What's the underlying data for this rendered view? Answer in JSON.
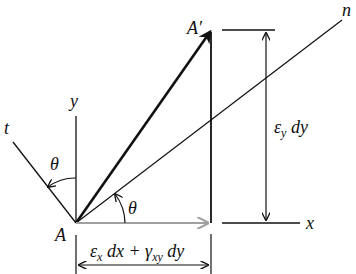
{
  "diagram": {
    "type": "strain-displacement-geometry",
    "labels": {
      "point_a": "A",
      "point_a_prime": "A′",
      "axis_x": "x",
      "axis_y": "y",
      "axis_n": "n",
      "axis_t": "t",
      "theta_upper": "θ",
      "theta_lower": "θ"
    },
    "vertical_dim": {
      "eps": "ε",
      "eps_sub": "y",
      "rest": " dy"
    },
    "horizontal_dim": {
      "eps": "ε",
      "eps_sub": "x",
      "mid": " dx + ",
      "gamma": "γ",
      "gamma_sub": "xy",
      "rest": " dy"
    },
    "colors": {
      "line": "#111111",
      "displacement_x": "#a0a0a0"
    }
  }
}
